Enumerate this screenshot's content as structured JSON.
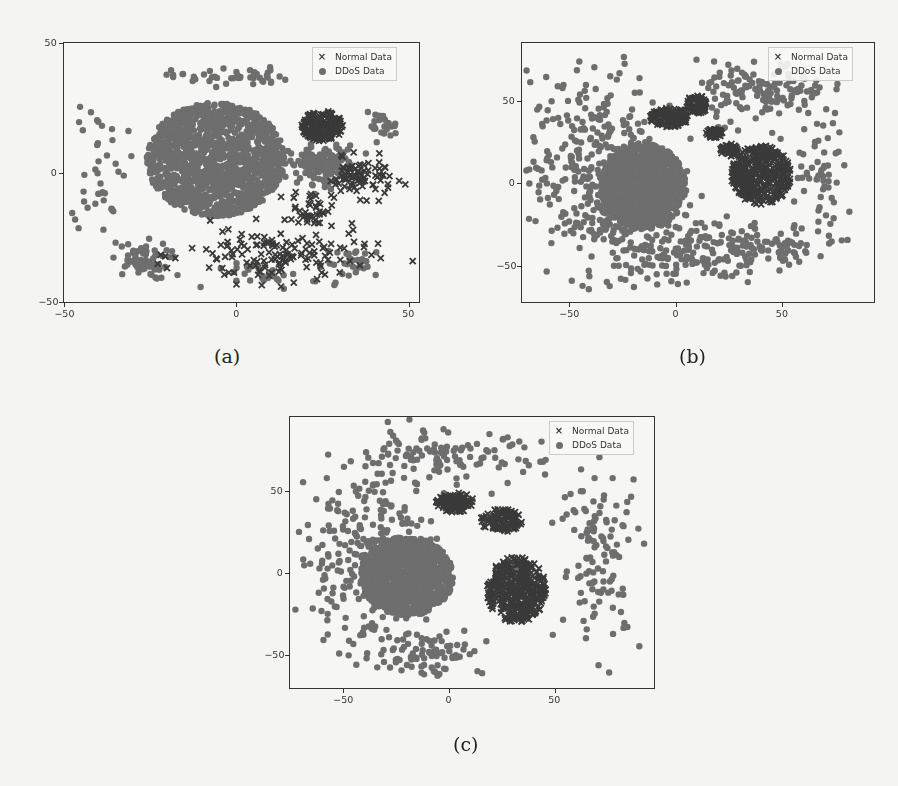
{
  "figure": {
    "panels": [
      {
        "id": "a",
        "caption": "(a)"
      },
      {
        "id": "b",
        "caption": "(b)"
      },
      {
        "id": "c",
        "caption": "(c)"
      }
    ],
    "legend": {
      "normal_label": "Normal Data",
      "ddos_label": "DDoS Data"
    },
    "colors": {
      "normal": "#3a3a3a",
      "ddos": "#6e6e6e",
      "background": "#f4f4f2"
    }
  },
  "chart_data": [
    {
      "type": "scatter",
      "title": "(a)",
      "xlabel": "",
      "ylabel": "",
      "xlim": [
        -50,
        53
      ],
      "ylim": [
        -50,
        50
      ],
      "xticks": [
        -50,
        0,
        50
      ],
      "yticks": [
        -50,
        0,
        50
      ],
      "legend": [
        "Normal Data",
        "DDoS Data"
      ],
      "legend_position": "upper right",
      "series": [
        {
          "name": "DDoS Data",
          "marker": "o",
          "clusters": [
            {
              "cx": -6,
              "cy": 5,
              "rx": 20,
              "ry": 22,
              "n": 1400,
              "kind": "dense"
            },
            {
              "cx": -40,
              "cy": 5,
              "rx": 4,
              "ry": 14,
              "n": 40,
              "kind": "ring"
            },
            {
              "cx": -28,
              "cy": -34,
              "rx": 7,
              "ry": 6,
              "n": 60,
              "kind": "blob"
            },
            {
              "cx": -2,
              "cy": 37,
              "rx": 14,
              "ry": 3,
              "n": 45,
              "kind": "blob"
            },
            {
              "cx": 25,
              "cy": 3,
              "rx": 8,
              "ry": 6,
              "n": 160,
              "kind": "blob"
            },
            {
              "cx": 42,
              "cy": 18,
              "rx": 4,
              "ry": 4,
              "n": 25,
              "kind": "blob"
            },
            {
              "cx": 35,
              "cy": -35,
              "rx": 8,
              "ry": 5,
              "n": 30,
              "kind": "blob"
            },
            {
              "cx": 10,
              "cy": -40,
              "rx": 12,
              "ry": 4,
              "n": 30,
              "kind": "blob"
            }
          ]
        },
        {
          "name": "Normal Data",
          "marker": "x",
          "clusters": [
            {
              "cx": 25,
              "cy": 18,
              "rx": 6,
              "ry": 6,
              "n": 200,
              "kind": "dense"
            },
            {
              "cx": 36,
              "cy": -2,
              "rx": 8,
              "ry": 6,
              "n": 80,
              "kind": "blob"
            },
            {
              "cx": 12,
              "cy": -32,
              "rx": 22,
              "ry": 9,
              "n": 140,
              "kind": "sparse"
            },
            {
              "cx": 22,
              "cy": -14,
              "rx": 5,
              "ry": 6,
              "n": 40,
              "kind": "sparse"
            }
          ]
        }
      ]
    },
    {
      "type": "scatter",
      "title": "(b)",
      "xlabel": "",
      "ylabel": "",
      "xlim": [
        -72,
        93
      ],
      "ylim": [
        -72,
        85
      ],
      "xticks": [
        -50,
        0,
        50
      ],
      "yticks": [
        -50,
        0,
        50
      ],
      "legend": [
        "Normal Data",
        "DDoS Data"
      ],
      "legend_position": "upper right",
      "series": [
        {
          "name": "DDoS Data",
          "marker": "o",
          "clusters": [
            {
              "cx": -15,
              "cy": -2,
              "rx": 20,
              "ry": 26,
              "n": 1200,
              "kind": "dense"
            },
            {
              "cx": -35,
              "cy": 5,
              "rx": 28,
              "ry": 50,
              "n": 420,
              "kind": "sparse"
            },
            {
              "cx": 5,
              "cy": -40,
              "rx": 30,
              "ry": 18,
              "n": 180,
              "kind": "sparse"
            },
            {
              "cx": 40,
              "cy": 55,
              "rx": 25,
              "ry": 15,
              "n": 140,
              "kind": "sparse"
            },
            {
              "cx": 70,
              "cy": -5,
              "rx": 12,
              "ry": 40,
              "n": 70,
              "kind": "sparse"
            },
            {
              "cx": 42,
              "cy": -40,
              "rx": 20,
              "ry": 8,
              "n": 50,
              "kind": "sparse"
            }
          ]
        },
        {
          "name": "Normal Data",
          "marker": "x",
          "clusters": [
            {
              "cx": 40,
              "cy": 5,
              "rx": 14,
              "ry": 18,
              "n": 420,
              "kind": "dense"
            },
            {
              "cx": -3,
              "cy": 40,
              "rx": 9,
              "ry": 6,
              "n": 120,
              "kind": "dense"
            },
            {
              "cx": 10,
              "cy": 48,
              "rx": 5,
              "ry": 6,
              "n": 70,
              "kind": "dense"
            },
            {
              "cx": 18,
              "cy": 30,
              "rx": 4,
              "ry": 3,
              "n": 40,
              "kind": "dense"
            },
            {
              "cx": 25,
              "cy": 20,
              "rx": 4,
              "ry": 4,
              "n": 40,
              "kind": "dense"
            }
          ]
        }
      ]
    },
    {
      "type": "scatter",
      "title": "(c)",
      "xlabel": "",
      "ylabel": "",
      "xlim": [
        -75,
        97
      ],
      "ylim": [
        -70,
        95
      ],
      "xticks": [
        -50,
        0,
        50
      ],
      "yticks": [
        -50,
        0,
        50
      ],
      "legend": [
        "Normal Data",
        "DDoS Data"
      ],
      "legend_position": "upper right",
      "series": [
        {
          "name": "DDoS Data",
          "marker": "o",
          "clusters": [
            {
              "cx": -20,
              "cy": -2,
              "rx": 22,
              "ry": 24,
              "n": 1200,
              "kind": "dense"
            },
            {
              "cx": -40,
              "cy": 10,
              "rx": 26,
              "ry": 48,
              "n": 260,
              "kind": "sparse"
            },
            {
              "cx": -5,
              "cy": 70,
              "rx": 40,
              "ry": 14,
              "n": 120,
              "kind": "sparse"
            },
            {
              "cx": 72,
              "cy": 10,
              "rx": 16,
              "ry": 45,
              "n": 120,
              "kind": "sparse"
            },
            {
              "cx": -10,
              "cy": -48,
              "rx": 22,
              "ry": 12,
              "n": 80,
              "kind": "sparse"
            },
            {
              "cx": 30,
              "cy": -3,
              "rx": 8,
              "ry": 10,
              "n": 140,
              "kind": "dense"
            }
          ]
        },
        {
          "name": "Normal Data",
          "marker": "x",
          "clusters": [
            {
              "cx": 32,
              "cy": -10,
              "rx": 14,
              "ry": 20,
              "n": 380,
              "kind": "dense"
            },
            {
              "cx": 3,
              "cy": 43,
              "rx": 9,
              "ry": 6,
              "n": 110,
              "kind": "dense"
            },
            {
              "cx": 25,
              "cy": 32,
              "rx": 10,
              "ry": 7,
              "n": 110,
              "kind": "dense"
            }
          ]
        }
      ]
    }
  ]
}
